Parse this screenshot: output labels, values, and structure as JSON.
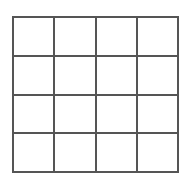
{
  "diagram": {
    "type": "grid",
    "rows": 4,
    "columns": 4,
    "line_color": "#555555",
    "background": "#ffffff",
    "cells": [
      [
        "",
        "",
        "",
        ""
      ],
      [
        "",
        "",
        "",
        ""
      ],
      [
        "",
        "",
        "",
        ""
      ],
      [
        "",
        "",
        "",
        ""
      ]
    ]
  }
}
